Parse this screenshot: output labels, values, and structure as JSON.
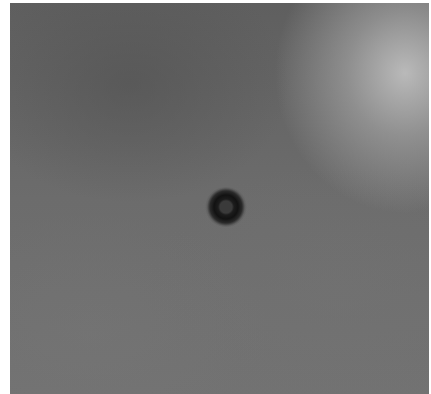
{
  "image": {
    "description": "Grayscale micrograph with a small dark ring-shaped particle near the center on a mottled gray background, brighter toward the top-right corner",
    "colors": {
      "background_mid": "#6a6a6a",
      "background_dark": "#5a5a5a",
      "highlight_top_right": "#bdbdbd",
      "ring": "#141414",
      "border": "#ffffff"
    }
  }
}
